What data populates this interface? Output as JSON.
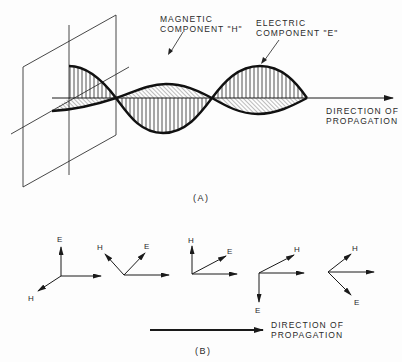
{
  "figure_a": {
    "caption": "(A)",
    "magnetic_label_line1": "MAGNETIC",
    "magnetic_label_line2": "COMPONENT \"H\"",
    "electric_label_line1": "ELECTRIC",
    "electric_label_line2": "COMPONENT \"E\"",
    "direction_line1": "DIRECTION OF",
    "direction_line2": "PROPAGATION"
  },
  "figure_b": {
    "caption": "(B)",
    "vectors": [
      {
        "e_label": "E",
        "h_label": "H"
      },
      {
        "e_label": "E",
        "h_label": "H"
      },
      {
        "e_label": "E",
        "h_label": "H"
      },
      {
        "e_label": "E",
        "h_label": "H"
      },
      {
        "e_label": "E",
        "h_label": "H"
      }
    ],
    "direction_line1": "DIRECTION OF",
    "direction_line2": "PROPAGATION"
  },
  "colors": {
    "ink": "#1a1a1a",
    "background": "#fdfdfd"
  }
}
